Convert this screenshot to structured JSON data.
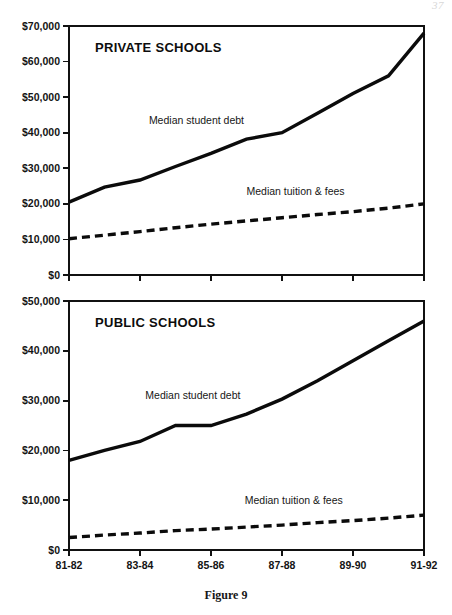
{
  "figure": {
    "caption": "Figure 9",
    "page_mark": "37"
  },
  "chart_data": [
    {
      "type": "line",
      "title": "PRIVATE SCHOOLS",
      "xlabel": "",
      "ylabel": "",
      "grid": false,
      "legend_position": "inline-annotation",
      "x": [
        "81-82",
        "83-84",
        "85-86",
        "87-88",
        "89-90",
        "91-92"
      ],
      "xtick_labels": [
        "81-82",
        "83-84",
        "85-86",
        "87-88",
        "89-90",
        "91-92"
      ],
      "ylim": [
        0,
        70000
      ],
      "ytick_values": [
        0,
        10000,
        20000,
        30000,
        40000,
        50000,
        60000,
        70000
      ],
      "ytick_labels": [
        "$0",
        "$10,000",
        "$20,000",
        "$30,000",
        "$40,000",
        "$50,000",
        "$60,000",
        "$70,000"
      ],
      "series": [
        {
          "name": "Median student debt",
          "style": "solid",
          "x": [
            "81-82",
            "82-83",
            "83-84",
            "84-85",
            "85-86",
            "86-87",
            "87-88",
            "88-89",
            "89-90",
            "90-91",
            "91-92"
          ],
          "values": [
            20500,
            24700,
            26700,
            30500,
            34200,
            38200,
            40000,
            45500,
            51000,
            56000,
            68000
          ]
        },
        {
          "name": "Median tuition & fees",
          "style": "dashed",
          "x": [
            "81-82",
            "82-83",
            "83-84",
            "84-85",
            "85-86",
            "86-87",
            "87-88",
            "88-89",
            "89-90",
            "90-91",
            "91-92"
          ],
          "values": [
            10200,
            11200,
            12200,
            13300,
            14300,
            15200,
            16100,
            17000,
            17800,
            18800,
            20000
          ]
        }
      ],
      "annotations": [
        {
          "text": "Median student debt",
          "x_frac": 0.225,
          "y_value": 42500
        },
        {
          "text": "Median tuition & fees",
          "x_frac": 0.5,
          "y_value": 22500
        }
      ]
    },
    {
      "type": "line",
      "title": "PUBLIC SCHOOLS",
      "xlabel": "",
      "ylabel": "",
      "grid": false,
      "legend_position": "inline-annotation",
      "x": [
        "81-82",
        "83-84",
        "85-86",
        "87-88",
        "89-90",
        "91-92"
      ],
      "xtick_labels": [
        "81-82",
        "83-84",
        "85-86",
        "87-88",
        "89-90",
        "91-92"
      ],
      "ylim": [
        0,
        50000
      ],
      "ytick_values": [
        0,
        10000,
        20000,
        30000,
        40000,
        50000
      ],
      "ytick_labels": [
        "$0",
        "$10,000",
        "$20,000",
        "$30,000",
        "$40,000",
        "$50,000"
      ],
      "series": [
        {
          "name": "Median student debt",
          "style": "solid",
          "x": [
            "81-82",
            "82-83",
            "83-84",
            "84-85",
            "85-86",
            "86-87",
            "87-88",
            "88-89",
            "89-90",
            "90-91",
            "91-92"
          ],
          "values": [
            18000,
            20000,
            21800,
            25000,
            25000,
            27300,
            30300,
            34000,
            38000,
            42000,
            46000
          ]
        },
        {
          "name": "Median tuition & fees",
          "style": "dashed",
          "x": [
            "81-82",
            "82-83",
            "83-84",
            "84-85",
            "85-86",
            "86-87",
            "87-88",
            "88-89",
            "89-90",
            "90-91",
            "91-92"
          ],
          "values": [
            2500,
            3000,
            3400,
            3900,
            4200,
            4600,
            5000,
            5500,
            5900,
            6400,
            7000
          ]
        }
      ],
      "annotations": [
        {
          "text": "Median student debt",
          "x_frac": 0.215,
          "y_value": 30400
        },
        {
          "text": "Median tuition & fees",
          "x_frac": 0.495,
          "y_value": 9300
        }
      ]
    }
  ]
}
